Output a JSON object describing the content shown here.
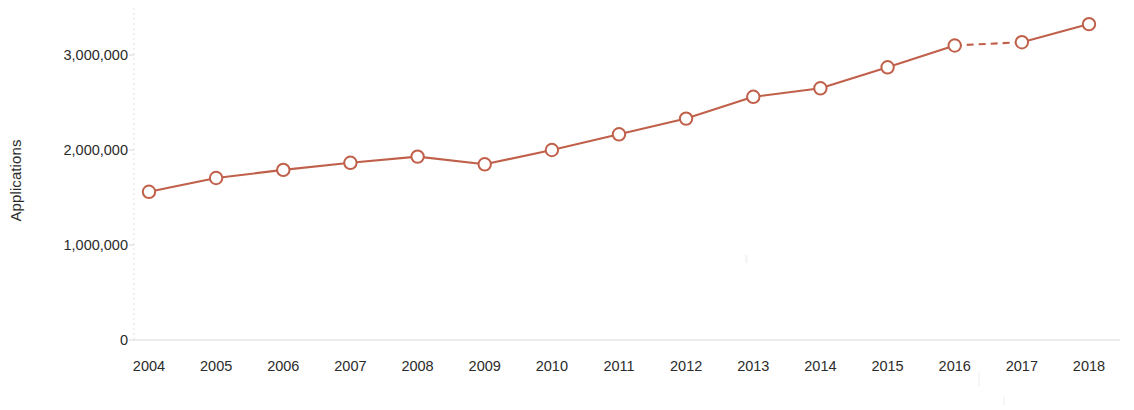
{
  "chart_data": {
    "type": "line",
    "title": "",
    "xlabel": "Application year",
    "ylabel": "Applications",
    "categories": [
      "2004",
      "2005",
      "2006",
      "2007",
      "2008",
      "2009",
      "2010",
      "2011",
      "2012",
      "2013",
      "2014",
      "2015",
      "2016",
      "2017",
      "2018"
    ],
    "x": [
      2004,
      2005,
      2006,
      2007,
      2008,
      2009,
      2010,
      2011,
      2012,
      2013,
      2014,
      2015,
      2016,
      2017,
      2018
    ],
    "values": [
      1560000,
      1705000,
      1790000,
      1865000,
      1930000,
      1850000,
      2000000,
      2165000,
      2330000,
      2560000,
      2650000,
      2870000,
      3100000,
      3135000,
      3325000
    ],
    "series": [
      {
        "name": "Applications",
        "values": [
          1560000,
          1705000,
          1790000,
          1865000,
          1930000,
          1850000,
          2000000,
          2165000,
          2330000,
          2560000,
          2650000,
          2870000,
          3100000,
          3135000,
          3325000
        ],
        "color": "#c0604a",
        "marker": "open-circle",
        "line_style": "solid",
        "dashed_segments": [
          [
            2016,
            2017
          ]
        ]
      }
    ],
    "ylim": [
      0,
      3500000
    ],
    "xlim": [
      2004,
      2018
    ],
    "yticks": [
      0,
      1000000,
      2000000,
      3000000
    ],
    "ytick_labels": [
      "0",
      "1,000,000",
      "2,000,000",
      "3,000,000"
    ],
    "xticks": [
      2004,
      2005,
      2006,
      2007,
      2008,
      2009,
      2010,
      2011,
      2012,
      2013,
      2014,
      2015,
      2016,
      2017,
      2018
    ],
    "xtick_labels": [
      "2004",
      "2005",
      "2006",
      "2007",
      "2008",
      "2009",
      "2010",
      "2011",
      "2012",
      "2013",
      "2014",
      "2015",
      "2016",
      "2017",
      "2018"
    ],
    "grid": false,
    "legend": false,
    "legend_position": "none",
    "annotations": [],
    "colors": {
      "line": "#c0604a",
      "marker_fill": "#ffffff",
      "marker_stroke": "#c0604a",
      "axis": "#dcdcdc",
      "text": "#2b2b2b",
      "background": "#ffffff"
    }
  }
}
